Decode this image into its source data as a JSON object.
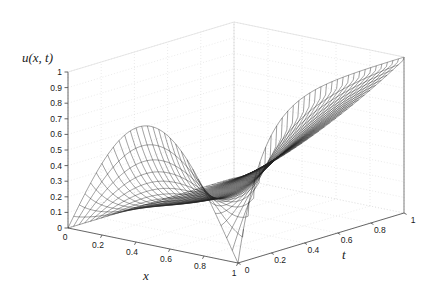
{
  "figure": {
    "kind": "matlab-3d-mesh-plot",
    "background_color": "#ffffff",
    "mesh_line_color": "#202020",
    "axis_line_color": "#555555",
    "grid_color": "#d8d8d8",
    "tick_text_color": "#1a1a1a"
  },
  "labels": {
    "z_axis": "u(x, t)",
    "x_axis": "x",
    "t_axis": "t"
  },
  "ticks": {
    "z": [
      "0",
      "0.1",
      "0.2",
      "0.3",
      "0.4",
      "0.5",
      "0.6",
      "0.7",
      "0.8",
      "0.9",
      "1"
    ],
    "x": [
      "0",
      "0.2",
      "0.4",
      "0.6",
      "0.8",
      "1"
    ],
    "t": [
      "0",
      "0.2",
      "0.4",
      "0.6",
      "0.8",
      "1"
    ]
  },
  "chart_data": {
    "type": "line",
    "title": "",
    "xlabel": "x",
    "ylabel": "t",
    "zlabel": "u(x, t)",
    "xlim": [
      0,
      1
    ],
    "ylim": [
      0,
      1
    ],
    "zlim": [
      0,
      1
    ],
    "grid": true,
    "legend": "none",
    "projection": {
      "origin_px": [
        68,
        228
      ],
      "x1_t0_px": [
        238,
        263
      ],
      "x1_t1_px": [
        404,
        213
      ],
      "x0_t1_px": [
        234,
        178
      ],
      "z_unit_px": [
        0,
        -156
      ]
    },
    "surface_description": "Mesh surface of a 1-D PDE solution u(x,t); hump in x near x~0.55 decaying in t on the left face, and a boundary layer rising to u=1 at x=1 as t grows.",
    "mesh_resolution": {
      "nx": 31,
      "nt": 31
    },
    "annotations": [],
    "sample_profiles": [
      {
        "t": 0.0,
        "u_at_x": [
          0.0,
          0.12,
          0.27,
          0.42,
          0.55,
          0.64,
          0.68,
          0.64,
          0.5,
          0.28,
          0.0
        ]
      },
      {
        "t": 0.2,
        "u_at_x": [
          0.0,
          0.07,
          0.16,
          0.25,
          0.32,
          0.36,
          0.38,
          0.38,
          0.4,
          0.6,
          1.0
        ]
      },
      {
        "t": 0.4,
        "u_at_x": [
          0.0,
          0.05,
          0.1,
          0.15,
          0.19,
          0.22,
          0.25,
          0.3,
          0.42,
          0.68,
          1.0
        ]
      },
      {
        "t": 0.6,
        "u_at_x": [
          0.0,
          0.03,
          0.07,
          0.1,
          0.13,
          0.16,
          0.21,
          0.3,
          0.47,
          0.72,
          1.0
        ]
      },
      {
        "t": 0.8,
        "u_at_x": [
          0.0,
          0.02,
          0.05,
          0.07,
          0.1,
          0.14,
          0.2,
          0.31,
          0.5,
          0.74,
          1.0
        ]
      },
      {
        "t": 1.0,
        "u_at_x": [
          0.0,
          0.02,
          0.04,
          0.06,
          0.09,
          0.13,
          0.2,
          0.32,
          0.51,
          0.75,
          1.0
        ]
      }
    ]
  }
}
